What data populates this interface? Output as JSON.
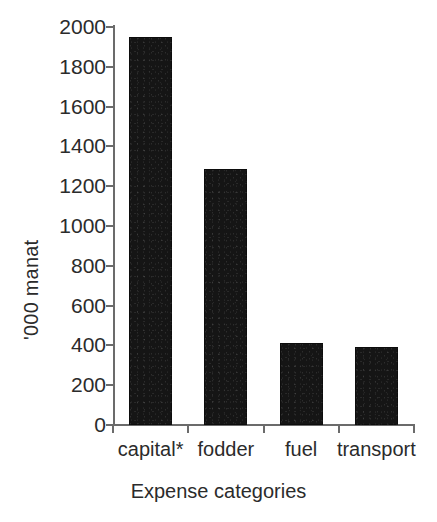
{
  "chart_data": {
    "type": "bar",
    "title": "",
    "subtitle": "",
    "categories": [
      "capital*",
      "fodder",
      "fuel",
      "transport"
    ],
    "values": [
      1950,
      1285,
      410,
      392
    ],
    "series": [
      {
        "name": "Expenses",
        "values": [
          1950,
          1285,
          410,
          392
        ]
      }
    ],
    "xlabel": "Expense categories",
    "ylabel": "'000 manat",
    "ylim": [
      0,
      2000
    ],
    "yticks": [
      0,
      200,
      400,
      600,
      800,
      1000,
      1200,
      1400,
      1600,
      1800,
      2000
    ],
    "ytick_labels": [
      "0",
      "200",
      "400",
      "600",
      "800",
      "1000",
      "1200",
      "1400",
      "1600",
      "1800",
      "2000"
    ],
    "grid": false,
    "legend": false,
    "legend_position": "none",
    "bar_color": "#151515",
    "axis_color": "#6b6b6b",
    "text_color": "#2b2b2b",
    "background_color": "#ffffff",
    "footnote": "*"
  },
  "axis": {
    "y_title": "'000 manat",
    "x_title": "Expense categories"
  }
}
